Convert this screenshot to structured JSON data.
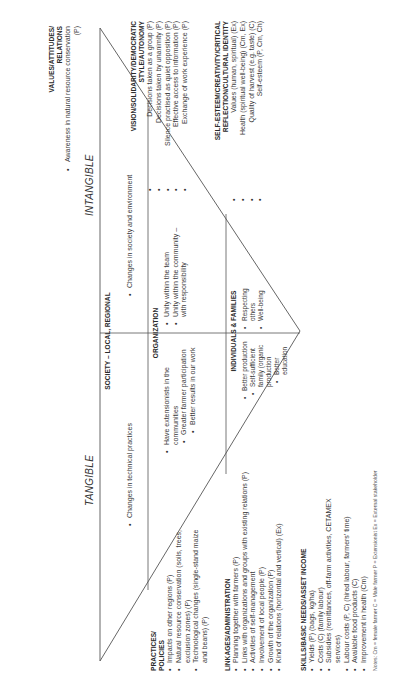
{
  "orientation": "rotated -90deg (landscape diagram shown portrait)",
  "axis_labels": {
    "tangible": "TANGIBLE",
    "intangible": "INTANGIBLE"
  },
  "triangle_sections": {
    "society": {
      "title": "SOCIETY – LOCAL, REGIONAL",
      "tangible_items": [
        "Changes in technical practices"
      ],
      "intangible_items": [
        "Changes in society and environment"
      ]
    },
    "organization": {
      "title": "ORGANIZATION",
      "tangible_items": [
        "Have extensionists in the communities",
        "Greater farmer participation",
        "Better results in our work"
      ],
      "intangible_items": [
        "Unity within the team",
        "Unity within the community – with responsibility"
      ]
    },
    "individuals": {
      "title": "INDIVIDUALS & FAMILIES",
      "tangible_items": [
        "Better production",
        "Self-sufficient family (organic production",
        "Better education"
      ],
      "intangible_items": [
        "Respecting others",
        "Well-being"
      ]
    }
  },
  "left_blocks": {
    "practices": {
      "title_line1": "PRACTICES/",
      "title_line2": "POLICIES",
      "items": [
        "Impacts on other regions (P)",
        "Natural resource conservation (soils, trees, exclusion zones) (P)",
        "Technological changes (single-stand maize and beans) (P)"
      ]
    },
    "linkages": {
      "title": "LINKAGES/ADMINISTRATION",
      "items": [
        "Planning together with farmers (P)",
        "Links with organizations and groups with existing relations (P)",
        "Activities of self-management",
        "Involvement of local people (P)",
        "Growth of the organization (P)",
        "Kind of relations (horizontal and vertical) (Ex)"
      ]
    },
    "skills": {
      "title": "SKILLS/BASIC NEEDS/ASSET INCOME",
      "items": [
        "Yields (P) (bags, kg/ha)",
        "Costs (C) (family labour)",
        "Subsidies (remittances, off-farm activities, CETAMEX services)",
        "Labour costs (P, C) (hired labour, farmers' time)",
        "Available food products (C)",
        "Improvement in health (Cm)"
      ]
    }
  },
  "right_blocks": {
    "values": {
      "title_line1": "VALUES/ATTITUDES/",
      "title_line2": "RELATIONS",
      "items": [
        "Awareness in natural resource conservation (P)"
      ]
    },
    "vision": {
      "title_line1": "VISION/SOLIDARITY/DEMOCRATIC",
      "title_line2": "STYLE/AUTONOMY",
      "items": [
        "Decisions taken as a group (P)",
        "Decisions taken by unanimity (P)",
        "Silence practised as quiet opposition (P)",
        "Effective access to information (P)",
        "Exchange of work experience (P)"
      ]
    },
    "selfesteem": {
      "title_line1": "SELF-ESTEEM/CREATIVITY/CRITICAL",
      "title_line2": "REFLECTION/CULTURAL IDENTITY",
      "items": [
        "Values (human, spiritual) (Ex)",
        "Health (spiritual well-being) (Cm, Ex)",
        "Quality of harvest (e.g. taste) (C)",
        "Self-esteem (P, Cm, Ch)"
      ]
    }
  },
  "notes": "Notes: Cm = female farmer  C = Male farmer  P = Extensionist  Ex = External stakeholder",
  "colors": {
    "text": "#3a3a3a",
    "lines": "#555555",
    "background": "#ffffff"
  }
}
